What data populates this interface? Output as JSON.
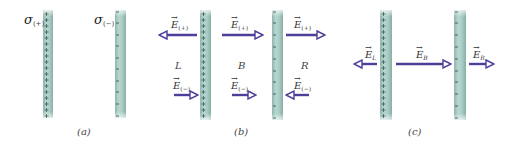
{
  "colors": {
    "plate_fill": "#a8ccc5",
    "plate_edge": "#7fa8a0",
    "plate_center": "#c4ddd8",
    "arrow": "#4b3f99",
    "text": "#333333"
  },
  "panels": [
    {
      "id": "a",
      "caption": "(a)",
      "plates": [
        {
          "charge": "+",
          "label_symbol": "σ",
          "label_sub": "(+)",
          "x": 43,
          "sign_marks": "+"
        },
        {
          "charge": "-",
          "label_symbol": "σ",
          "label_sub": "(−)",
          "x": 115,
          "sign_marks": "−"
        }
      ]
    },
    {
      "id": "b",
      "caption": "(b)",
      "regions": [
        "L",
        "B",
        "R"
      ],
      "plates": [
        {
          "charge": "+",
          "x": 200,
          "sign_marks": "+"
        },
        {
          "charge": "-",
          "x": 272,
          "sign_marks": "−"
        }
      ],
      "vectors": [
        {
          "label": "E",
          "sub": "(+)",
          "region": "L",
          "direction": "left"
        },
        {
          "label": "E",
          "sub": "(+)",
          "region": "B",
          "direction": "right"
        },
        {
          "label": "E",
          "sub": "(+)",
          "region": "R",
          "direction": "right"
        },
        {
          "label": "E",
          "sub": "(−)",
          "region": "L",
          "direction": "right"
        },
        {
          "label": "E",
          "sub": "(−)",
          "region": "B",
          "direction": "right"
        },
        {
          "label": "E",
          "sub": "(−)",
          "region": "R",
          "direction": "left"
        }
      ]
    },
    {
      "id": "c",
      "caption": "(c)",
      "plates": [
        {
          "charge": "+",
          "x": 380,
          "sign_marks": "+"
        },
        {
          "charge": "-",
          "x": 454,
          "sign_marks": "−"
        }
      ],
      "vectors": [
        {
          "label": "E",
          "sub": "L",
          "direction": "left"
        },
        {
          "label": "E",
          "sub": "B",
          "direction": "right"
        },
        {
          "label": "E",
          "sub": "R",
          "direction": "right"
        }
      ]
    }
  ],
  "text": {
    "sigma": "σ",
    "sub_plus": "(+)",
    "sub_minus": "(−)",
    "E": "E",
    "vec_arrow": "→",
    "region_L": "L",
    "region_B": "B",
    "region_R": "R",
    "sub_L": "L",
    "sub_B": "B",
    "sub_R": "R",
    "caption_a": "(a)",
    "caption_b": "(b)",
    "caption_c": "(c)"
  }
}
